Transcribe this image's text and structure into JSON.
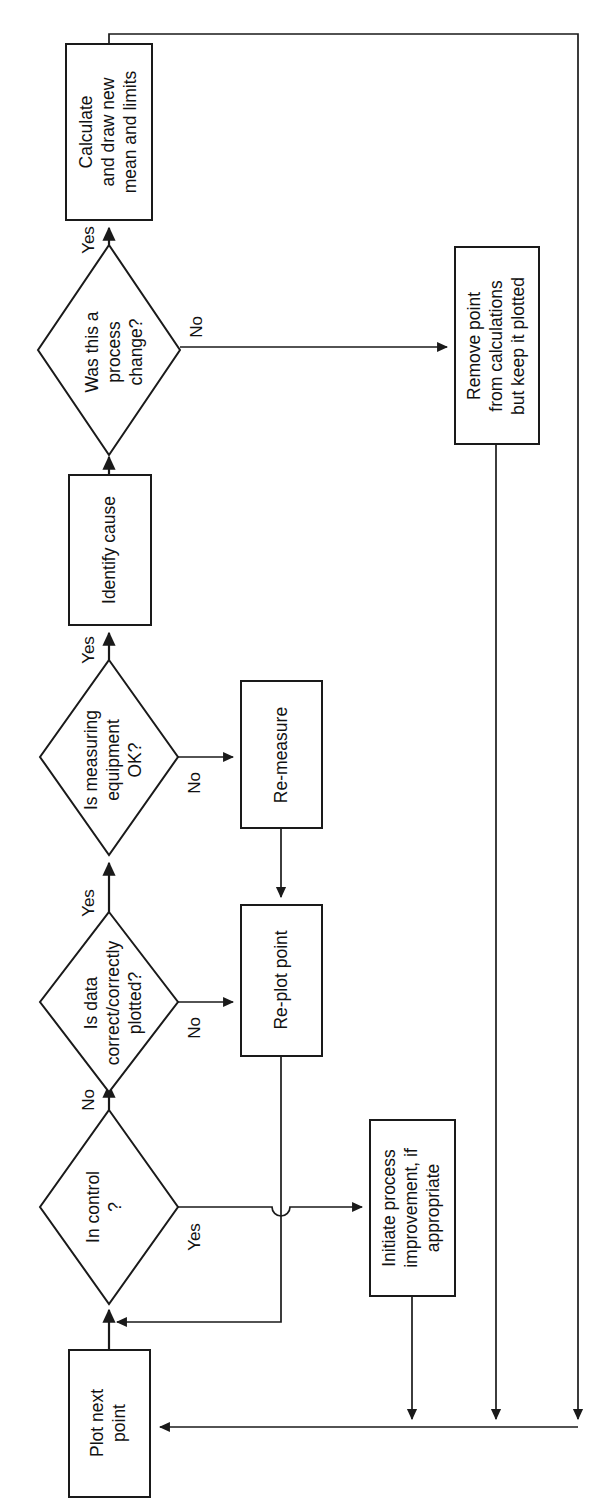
{
  "diagram": {
    "orientation": "rotated-90-ccw",
    "stroke_color": "#1a1a1a",
    "fill_color": "#ffffff"
  },
  "nodes": {
    "calculate": {
      "type": "process",
      "line1": "Calculate",
      "line2": "and draw new",
      "line3": "mean and limits"
    },
    "process_change": {
      "type": "decision",
      "line1": "Was this a",
      "line2": "process",
      "line3": "change?"
    },
    "remove_point": {
      "type": "process",
      "line1": "Remove point",
      "line2": "from calculations",
      "line3": "but keep it plotted"
    },
    "identify_cause": {
      "type": "process",
      "line1": "Identify cause"
    },
    "measuring_ok": {
      "type": "decision",
      "line1": "Is measuring",
      "line2": "equipment",
      "line3": "OK?"
    },
    "re_measure": {
      "type": "process",
      "line1": "Re-measure"
    },
    "data_correct": {
      "type": "decision",
      "line1": "Is data",
      "line2": "correct/correctly",
      "line3": "plotted?"
    },
    "re_plot": {
      "type": "process",
      "line1": "Re-plot point"
    },
    "in_control": {
      "type": "decision",
      "line1": "In control",
      "line2": "?"
    },
    "initiate_improvement": {
      "type": "process",
      "line1": "Initiate process",
      "line2": "improvement, if",
      "line3": "appropriate"
    },
    "plot_next": {
      "type": "process",
      "line1": "Plot next",
      "line2": "point"
    }
  },
  "edge_labels": {
    "process_change_yes": "Yes",
    "process_change_no": "No",
    "measuring_yes": "Yes",
    "measuring_no": "No",
    "data_yes": "Yes",
    "data_no": "No",
    "in_control_no": "No",
    "in_control_yes": "Yes"
  }
}
